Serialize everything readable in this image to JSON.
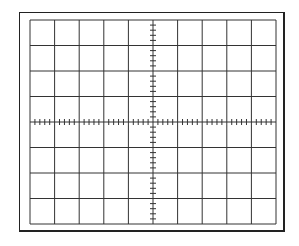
{
  "graticule": {
    "description": "Oscilloscope graticule",
    "divisions_x": 10,
    "divisions_y": 8,
    "minor_ticks_per_division": 5,
    "grid_color": "#333333",
    "frame_color": "#222222",
    "background": "#ffffff",
    "inner": {
      "left": 30,
      "top": 20,
      "right": 276,
      "bottom": 224
    }
  }
}
